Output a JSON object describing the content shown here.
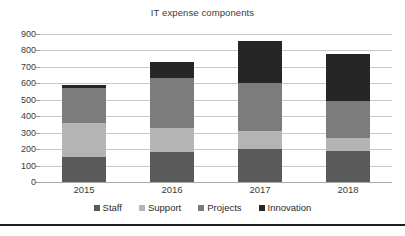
{
  "chart_data": {
    "type": "bar",
    "subtype": "stacked-column",
    "title": "IT expense components",
    "xlabel": "",
    "ylabel": "",
    "categories": [
      "2015",
      "2016",
      "2017",
      "2018"
    ],
    "series": [
      {
        "name": "Staff",
        "values": [
          150,
          180,
          200,
          190
        ],
        "color": "#5a5a5a"
      },
      {
        "name": "Support",
        "values": [
          210,
          150,
          110,
          80
        ],
        "color": "#b4b4b4"
      },
      {
        "name": "Projects",
        "values": [
          210,
          300,
          295,
          220
        ],
        "color": "#7c7c7c"
      },
      {
        "name": "Innovation",
        "values": [
          20,
          100,
          250,
          290
        ],
        "color": "#262626"
      }
    ],
    "totals": [
      590,
      730,
      855,
      780
    ],
    "ylim": [
      0,
      900
    ],
    "ytick_step": 100,
    "ytick_labels": [
      "900",
      "800",
      "700",
      "600",
      "500",
      "400",
      "300",
      "200",
      "100",
      "0"
    ],
    "grid": true,
    "legend_position": "bottom"
  },
  "legend": {
    "items": [
      {
        "label": "Staff"
      },
      {
        "label": "Support"
      },
      {
        "label": "Projects"
      },
      {
        "label": "Innovation"
      }
    ]
  }
}
